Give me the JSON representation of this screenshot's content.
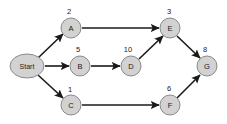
{
  "diagram": {
    "background_color": "#ffffff",
    "node_fill_color": "#d2d2d2",
    "node_stroke_color": "#8a8a8a",
    "edge_color": "#1a1a1a",
    "nodes": [
      {
        "id": "start",
        "label": "Start",
        "weight": "",
        "cx": 27,
        "cy": 66,
        "rx": 17,
        "ry": 12,
        "shape": "ellipse"
      },
      {
        "id": "a",
        "label": "A",
        "weight": "2",
        "cx": 71,
        "cy": 28,
        "rx": 10,
        "ry": 10,
        "shape": "circle",
        "wx": 69,
        "wy": 11
      },
      {
        "id": "b",
        "label": "B",
        "weight": "5",
        "cx": 80,
        "cy": 66,
        "rx": 10,
        "ry": 10,
        "shape": "circle",
        "wx": 78,
        "wy": 49
      },
      {
        "id": "c",
        "label": "C",
        "weight": "1",
        "cx": 71,
        "cy": 105,
        "rx": 10,
        "ry": 10,
        "shape": "circle",
        "wx": 70,
        "wy": 89
      },
      {
        "id": "d",
        "label": "D",
        "weight": "10",
        "cx": 131,
        "cy": 66,
        "rx": 10,
        "ry": 10,
        "shape": "circle",
        "wx": 128,
        "wy": 49
      },
      {
        "id": "e",
        "label": "E",
        "weight": "3",
        "cx": 170,
        "cy": 28,
        "rx": 10,
        "ry": 10,
        "shape": "circle",
        "wx": 169,
        "wy": 11
      },
      {
        "id": "f",
        "label": "F",
        "weight": "6",
        "cx": 170,
        "cy": 105,
        "rx": 10,
        "ry": 10,
        "shape": "circle",
        "wx": 169,
        "wy": 88
      },
      {
        "id": "g",
        "label": "G",
        "weight": "8",
        "cx": 207,
        "cy": 66,
        "rx": 10,
        "ry": 10,
        "shape": "circle",
        "wx": 205,
        "wy": 49
      }
    ],
    "edges": [
      {
        "id": "start-a",
        "from": "start",
        "to": "a",
        "x1": 38,
        "y1": 58,
        "x2": 63,
        "y2": 34
      },
      {
        "id": "start-b",
        "from": "start",
        "to": "b",
        "x1": 45,
        "y1": 66,
        "x2": 69,
        "y2": 66
      },
      {
        "id": "start-c",
        "from": "start",
        "to": "c",
        "x1": 38,
        "y1": 75,
        "x2": 63,
        "y2": 98
      },
      {
        "id": "a-e",
        "from": "a",
        "to": "e",
        "x1": 82,
        "y1": 28,
        "x2": 159,
        "y2": 28
      },
      {
        "id": "b-d",
        "from": "b",
        "to": "d",
        "x1": 91,
        "y1": 66,
        "x2": 120,
        "y2": 66
      },
      {
        "id": "d-e",
        "from": "d",
        "to": "e",
        "x1": 139,
        "y1": 59,
        "x2": 163,
        "y2": 36
      },
      {
        "id": "e-g",
        "from": "e",
        "to": "g",
        "x1": 177,
        "y1": 36,
        "x2": 200,
        "y2": 58
      },
      {
        "id": "c-f",
        "from": "c",
        "to": "f",
        "x1": 82,
        "y1": 105,
        "x2": 159,
        "y2": 105
      },
      {
        "id": "f-g",
        "from": "f",
        "to": "g",
        "x1": 177,
        "y1": 98,
        "x2": 200,
        "y2": 75
      }
    ]
  }
}
